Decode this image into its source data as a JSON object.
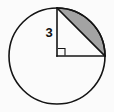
{
  "figure": {
    "kind": "circle-with-inscribed-right-triangle-and-shaded-segment",
    "background_color": "#fbfbfb",
    "stroke_color": "#141414",
    "shaded_fill_color": "#a3a3a3",
    "labels": {
      "radius": "3"
    },
    "geometry": {
      "circle": {
        "cx": 57,
        "cy": 56,
        "r": 48
      },
      "center_point": {
        "x": 57,
        "y": 56
      },
      "top_point": {
        "x": 57,
        "y": 8
      },
      "right_point": {
        "x": 105,
        "y": 56
      },
      "vertical_radius": {
        "x1": 57,
        "y1": 8,
        "x2": 57,
        "y2": 56
      },
      "horizontal_radius": {
        "x1": 57,
        "y1": 56,
        "x2": 105,
        "y2": 56
      },
      "chord": {
        "x1": 57,
        "y1": 8,
        "x2": 105,
        "y2": 56
      },
      "right_angle_marker": {
        "x": 58,
        "y": 48,
        "size": 7
      },
      "shaded_segment_arc": "quarter arc from top point to right point, bounded by chord",
      "radius_label_position": {
        "x": 49,
        "y": 37
      }
    },
    "strokes": {
      "circle_width": 1.6,
      "line_width": 1.6,
      "right_angle_width": 1.1
    }
  }
}
